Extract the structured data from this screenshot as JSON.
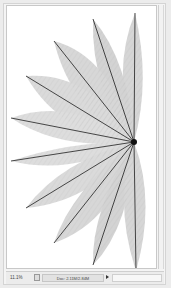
{
  "document": {
    "image_description": "fan of translucent skeleton leaves radiating from a point on the right edge"
  },
  "status_bar": {
    "zoom_level": "11.1%",
    "doc_info": "Doc: 2.11M/2.84M",
    "arrow_icon": "triangle-right-icon",
    "status_icon": "document-icon"
  },
  "colors": {
    "canvas": "#ffffff",
    "chrome": "#ececec",
    "leaf_vein": "#1a1a1a",
    "leaf_fill": "#9a9a9a"
  }
}
